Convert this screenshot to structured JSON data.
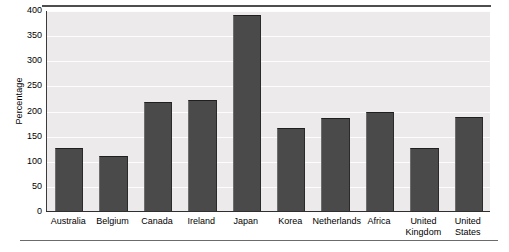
{
  "chart_data": {
    "type": "bar",
    "title": "",
    "xlabel": "",
    "ylabel": "Percentage",
    "categories": [
      "Australia",
      "Belgium",
      "Canada",
      "Ireland",
      "Japan",
      "Korea",
      "Netherlands",
      "Africa",
      "United\nKingdom",
      "United\nStates"
    ],
    "values": [
      128,
      112,
      219,
      223,
      392,
      167,
      187,
      199,
      128,
      190
    ],
    "ylim": [
      0,
      400
    ],
    "ytick_labels": [
      "0",
      "50",
      "100",
      "150",
      "200",
      "250",
      "300",
      "350",
      "400"
    ],
    "ytick_values": [
      0,
      50,
      100,
      150,
      200,
      250,
      300,
      350,
      400
    ],
    "grid": true,
    "legend": false,
    "bar_color": "#4a4a4a",
    "plot_background": "#eceaea",
    "gridline_color": "#fdfdfd",
    "axis_color": "#2f2f2f"
  }
}
